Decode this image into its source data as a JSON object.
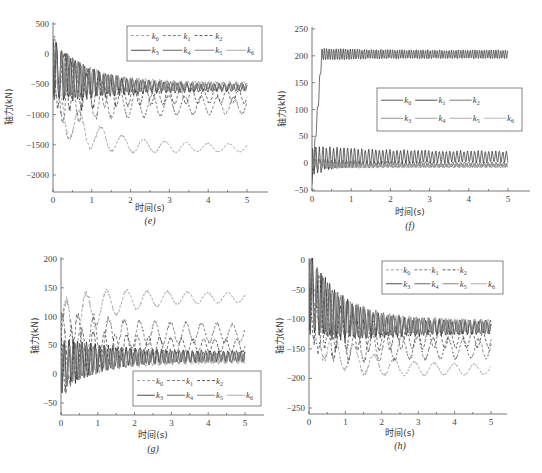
{
  "figure": {
    "x_axis_label": "时间(s)",
    "y_axis_label": "轴力(kN)"
  },
  "chart_data": [
    {
      "id": "e",
      "panel_label": "(e)",
      "type": "line",
      "xlabel": "时间(s)",
      "ylabel": "轴力(kN)",
      "xlim": [
        0,
        5.5
      ],
      "ylim": [
        -2250,
        500
      ],
      "xticks": [
        0,
        1,
        2,
        3,
        4,
        5
      ],
      "yticks": [
        500,
        0,
        -500,
        -1000,
        -1500,
        -2000
      ],
      "grid": false,
      "legend": {
        "position": "upper right",
        "entries": [
          "k0",
          "k1",
          "k2",
          "k3",
          "k4",
          "k5",
          "k6"
        ],
        "dashed": [
          "k0",
          "k1",
          "k2"
        ],
        "solid": [
          "k3",
          "k4",
          "k5",
          "k6"
        ]
      },
      "series": [
        {
          "name": "k0",
          "style": "dashed",
          "color": "#8a8a8a",
          "start": 250,
          "mean_end": -1550,
          "amp0": 450,
          "amp_end": 60,
          "period": 0.55
        },
        {
          "name": "k1",
          "style": "dashed",
          "color": "#555555",
          "start": 200,
          "mean_end": -850,
          "amp0": 650,
          "amp_end": 130,
          "period": 0.42
        },
        {
          "name": "k2",
          "style": "dashed",
          "color": "#333333",
          "start": 150,
          "mean_end": -700,
          "amp0": 550,
          "amp_end": 100,
          "period": 0.3
        },
        {
          "name": "k3",
          "style": "solid",
          "color": "#222222",
          "start": 200,
          "mean_end": -560,
          "amp0": 500,
          "amp_end": 50,
          "period": 0.12
        },
        {
          "name": "k4",
          "style": "solid",
          "color": "#444444",
          "start": 180,
          "mean_end": -540,
          "amp0": 450,
          "amp_end": 50,
          "period": 0.14
        },
        {
          "name": "k5",
          "style": "solid",
          "color": "#666666",
          "start": 160,
          "mean_end": -520,
          "amp0": 420,
          "amp_end": 45,
          "period": 0.16
        },
        {
          "name": "k6",
          "style": "solid",
          "color": "#999999",
          "start": 140,
          "mean_end": -500,
          "amp0": 400,
          "amp_end": 40,
          "period": 0.18
        }
      ]
    },
    {
      "id": "f",
      "panel_label": "(f)",
      "type": "line",
      "xlabel": "时间(s)",
      "ylabel": "轴力(kN)",
      "xlim": [
        0,
        5.5
      ],
      "ylim": [
        -50,
        250
      ],
      "xticks": [
        0,
        1,
        2,
        3,
        4,
        5
      ],
      "yticks": [
        250,
        200,
        150,
        100,
        50,
        0,
        -50
      ],
      "grid": false,
      "legend": {
        "position": "center right",
        "entries": [
          "k0",
          "k1",
          "k2",
          "k3",
          "k4",
          "k5",
          "k6"
        ],
        "dashed": [],
        "solid": [
          "k0",
          "k1",
          "k2",
          "k3",
          "k4",
          "k5",
          "k6"
        ]
      },
      "series": [
        {
          "name": "k0",
          "style": "solid",
          "color": "#333333",
          "start": -40,
          "mean_end": 203,
          "amp0": 12,
          "amp_end": 8,
          "period": 0.06,
          "rise": 0.25
        },
        {
          "name": "k1",
          "style": "solid",
          "color": "#222222",
          "start": -30,
          "mean_end": 12,
          "amp0": 25,
          "amp_end": 10,
          "period": 0.09
        },
        {
          "name": "k2",
          "style": "solid",
          "color": "#555555",
          "start": 0,
          "mean_end": -2,
          "amp0": 10,
          "amp_end": 4,
          "period": 0.1
        },
        {
          "name": "k3",
          "style": "solid",
          "color": "#777777",
          "start": 0,
          "mean_end": -4,
          "amp0": 8,
          "amp_end": 3,
          "period": 0.11
        },
        {
          "name": "k4",
          "style": "solid",
          "color": "#888888",
          "start": 0,
          "mean_end": -5,
          "amp0": 7,
          "amp_end": 3,
          "period": 0.12
        },
        {
          "name": "k5",
          "style": "solid",
          "color": "#999999",
          "start": 0,
          "mean_end": -6,
          "amp0": 6,
          "amp_end": 2,
          "period": 0.13
        },
        {
          "name": "k6",
          "style": "solid",
          "color": "#aaaaaa",
          "start": 0,
          "mean_end": -6,
          "amp0": 5,
          "amp_end": 2,
          "period": 0.14
        }
      ]
    },
    {
      "id": "g",
      "panel_label": "(g)",
      "type": "line",
      "xlabel": "时间(s)",
      "ylabel": "轴力(kN)",
      "xlim": [
        0,
        5.5
      ],
      "ylim": [
        -70,
        200
      ],
      "xticks": [
        0,
        1,
        2,
        3,
        4,
        5
      ],
      "yticks": [
        200,
        150,
        100,
        50,
        0,
        -50
      ],
      "grid": false,
      "legend": {
        "position": "lower right",
        "entries": [
          "k0",
          "k1",
          "k2",
          "k3",
          "k4",
          "k5",
          "k6"
        ],
        "dashed": [
          "k0",
          "k1",
          "k2"
        ],
        "solid": [
          "k3",
          "k4",
          "k5",
          "k6"
        ]
      },
      "series": [
        {
          "name": "k0",
          "style": "dashed",
          "color": "#8a8a8a",
          "start": -20,
          "mean_end": 133,
          "amp0": 60,
          "amp_end": 8,
          "period": 0.55
        },
        {
          "name": "k1",
          "style": "dashed",
          "color": "#555555",
          "start": -20,
          "mean_end": 72,
          "amp0": 70,
          "amp_end": 15,
          "period": 0.42
        },
        {
          "name": "k2",
          "style": "dashed",
          "color": "#333333",
          "start": -20,
          "mean_end": 50,
          "amp0": 60,
          "amp_end": 10,
          "period": 0.3
        },
        {
          "name": "k3",
          "style": "solid",
          "color": "#222222",
          "start": -30,
          "mean_end": 32,
          "amp0": 45,
          "amp_end": 8,
          "period": 0.12
        },
        {
          "name": "k4",
          "style": "solid",
          "color": "#444444",
          "start": -30,
          "mean_end": 30,
          "amp0": 42,
          "amp_end": 8,
          "period": 0.14
        },
        {
          "name": "k5",
          "style": "solid",
          "color": "#666666",
          "start": -30,
          "mean_end": 28,
          "amp0": 40,
          "amp_end": 7,
          "period": 0.16
        },
        {
          "name": "k6",
          "style": "solid",
          "color": "#999999",
          "start": -30,
          "mean_end": 26,
          "amp0": 38,
          "amp_end": 7,
          "period": 0.18
        }
      ]
    },
    {
      "id": "h",
      "panel_label": "(h)",
      "type": "line",
      "xlabel": "时间(s)",
      "ylabel": "轴力(kN)",
      "xlim": [
        0,
        5.5
      ],
      "ylim": [
        -260,
        0
      ],
      "xticks": [
        0,
        1,
        2,
        3,
        4,
        5
      ],
      "yticks": [
        0,
        -50,
        -100,
        -150,
        -200,
        -250
      ],
      "grid": false,
      "legend": {
        "position": "upper right",
        "entries": [
          "k0",
          "k1",
          "k2",
          "k3",
          "k4",
          "k5",
          "k6"
        ],
        "dashed": [
          "k0",
          "k1",
          "k2"
        ],
        "solid": [
          "k3",
          "k4",
          "k5",
          "k6"
        ]
      },
      "series": [
        {
          "name": "k0",
          "style": "dashed",
          "color": "#8a8a8a",
          "start": -5,
          "mean_end": -185,
          "amp0": 55,
          "amp_end": 8,
          "period": 0.55
        },
        {
          "name": "k1",
          "style": "dashed",
          "color": "#555555",
          "start": -5,
          "mean_end": -150,
          "amp0": 75,
          "amp_end": 15,
          "period": 0.42
        },
        {
          "name": "k2",
          "style": "dashed",
          "color": "#333333",
          "start": -5,
          "mean_end": -135,
          "amp0": 70,
          "amp_end": 12,
          "period": 0.3
        },
        {
          "name": "k3",
          "style": "solid",
          "color": "#222222",
          "start": -5,
          "mean_end": -115,
          "amp0": 65,
          "amp_end": 10,
          "period": 0.12
        },
        {
          "name": "k4",
          "style": "solid",
          "color": "#444444",
          "start": -5,
          "mean_end": -113,
          "amp0": 62,
          "amp_end": 10,
          "period": 0.14
        },
        {
          "name": "k5",
          "style": "solid",
          "color": "#666666",
          "start": -5,
          "mean_end": -111,
          "amp0": 60,
          "amp_end": 9,
          "period": 0.16
        },
        {
          "name": "k6",
          "style": "solid",
          "color": "#999999",
          "start": -5,
          "mean_end": -110,
          "amp0": 58,
          "amp_end": 9,
          "period": 0.18
        }
      ]
    }
  ],
  "layout": {
    "panels": [
      {
        "id": "e",
        "plot": {
          "x0": 53,
          "x5": 247,
          "xend": 268,
          "ytop_val": 500,
          "ytop_px": 24,
          "ybot_val": -2000,
          "ybot_px": 175,
          "axis_y": 192,
          "axis_top": 22
        },
        "legend": {
          "x": 127,
          "y": 26,
          "w": 135,
          "h": 35
        },
        "label_y": 211,
        "panel_label_y": 224,
        "ylabel_x": 12
      },
      {
        "id": "f",
        "plot": {
          "x0": 312,
          "x5": 508,
          "xend": 530,
          "ytop_val": 250,
          "ytop_px": 29,
          "ybot_val": -50,
          "ybot_px": 190,
          "axis_y": 191,
          "axis_top": 27
        },
        "legend": {
          "x": 377,
          "y": 88,
          "w": 145,
          "h": 43
        },
        "label_y": 215,
        "panel_label_y": 229,
        "ylabel_x": 285
      },
      {
        "id": "g",
        "plot": {
          "x0": 61,
          "x5": 245,
          "xend": 264,
          "ytop_val": 200,
          "ytop_px": 259,
          "ybot_val": -50,
          "ybot_px": 403,
          "axis_y": 415,
          "axis_top": 257
        },
        "legend": {
          "x": 133,
          "y": 371,
          "w": 128,
          "h": 35
        },
        "label_y": 438,
        "panel_label_y": 452,
        "ylabel_x": 38
      },
      {
        "id": "h",
        "plot": {
          "x0": 309,
          "x5": 491,
          "xend": 507,
          "ytop_val": 0,
          "ytop_px": 260,
          "ybot_val": -250,
          "ybot_px": 408,
          "axis_y": 414,
          "axis_top": 258
        },
        "legend": {
          "x": 382,
          "y": 261,
          "w": 121,
          "h": 33
        },
        "label_y": 436,
        "panel_label_y": 449,
        "ylabel_x": 283
      }
    ]
  }
}
